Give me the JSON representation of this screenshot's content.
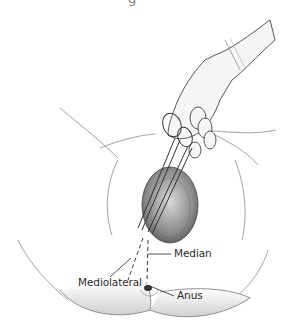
{
  "figure": {
    "top_caption_fragment": "g",
    "labels": {
      "median": "Median",
      "mediolateral": "Mediolateral",
      "anus": "Anus"
    },
    "colors": {
      "line": "#3a3a3a",
      "shade": "#9a9a9a",
      "label_text": "#2a2a2a",
      "background": "#ffffff"
    }
  }
}
